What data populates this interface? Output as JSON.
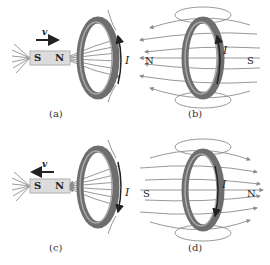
{
  "figure": {
    "panels": [
      {
        "id": "a",
        "caption": "(a)",
        "magnet": {
          "left_pole": "S",
          "right_pole": "N"
        },
        "velocity_label": "v",
        "velocity_direction": "right",
        "current_label": "I",
        "current_direction": "up"
      },
      {
        "id": "b",
        "caption": "(b)",
        "left_pole": "N",
        "right_pole": "S",
        "current_label": "I",
        "current_direction": "up"
      },
      {
        "id": "c",
        "caption": "(c)",
        "magnet": {
          "left_pole": "S",
          "right_pole": "N"
        },
        "velocity_label": "v",
        "velocity_direction": "left",
        "current_label": "I",
        "current_direction": "down"
      },
      {
        "id": "d",
        "caption": "(d)",
        "left_pole": "S",
        "right_pole": "N",
        "current_label": "I",
        "current_direction": "down"
      }
    ],
    "colors": {
      "ring": "#6e6e6e",
      "ring_highlight": "#a8a8a8",
      "field_lines": "#8c8c8c",
      "magnet": "#dcdcdc",
      "arrow": "#222222"
    }
  }
}
